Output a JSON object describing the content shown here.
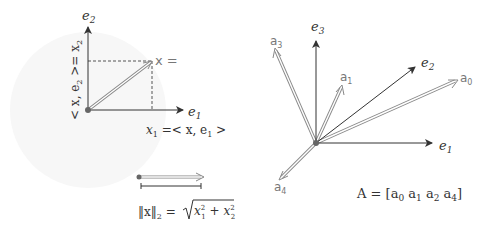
{
  "left_panel": {
    "axes": {
      "e1_label": "e",
      "e1_sub": "1",
      "e2_label": "e",
      "e2_sub": "2"
    },
    "vector_label": "x =",
    "projection_x1": {
      "lhs": "x",
      "lhs_sub": "1",
      "rhs": "=< x, e",
      "rhs_sub": "1",
      "close": " >"
    },
    "projection_x2": {
      "text": "< x, e",
      "sub": "2",
      "rest": " >= x",
      "rest_sub": "2"
    },
    "norm": {
      "lhs": "‖x‖",
      "lhs_sub": "2",
      "eq": " = ",
      "term1": "x",
      "term1_sub": "1",
      "term1_sup": "2",
      "plus": " + ",
      "term2": "x",
      "term2_sub": "2",
      "term2_sup": "2"
    }
  },
  "right_panel": {
    "axes": [
      {
        "name": "e",
        "sub": "1"
      },
      {
        "name": "e",
        "sub": "2"
      },
      {
        "name": "e",
        "sub": "3"
      }
    ],
    "vectors": [
      {
        "name": "a",
        "sub": "0"
      },
      {
        "name": "a",
        "sub": "1"
      },
      {
        "name": "a",
        "sub": "3"
      },
      {
        "name": "a",
        "sub": "4"
      }
    ],
    "matrix_label": {
      "prefix": "A = [",
      "items": [
        {
          "name": "a",
          "sub": "0"
        },
        {
          "name": "a",
          "sub": "1"
        },
        {
          "name": "a",
          "sub": "2"
        },
        {
          "name": "a",
          "sub": "4"
        }
      ],
      "suffix": "]"
    }
  },
  "colors": {
    "axis": "#333333",
    "vector_outline": "#888888",
    "dashed": "#555555",
    "circle_bg": "#f7f7f7",
    "origin_dot": "#666666"
  }
}
